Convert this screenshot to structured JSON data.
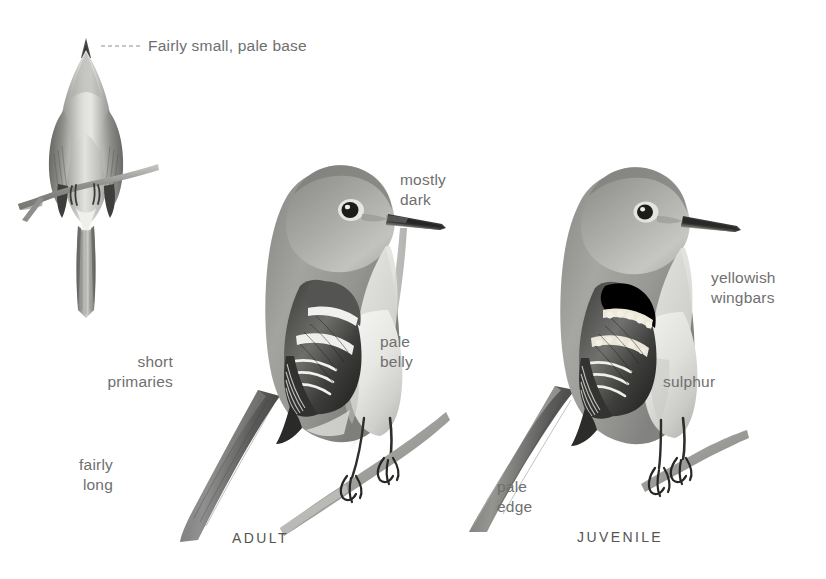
{
  "plate": {
    "medium": "graphite pencil field-guide illustration",
    "background_color": "#ffffff",
    "label_color": "#6f6f6f",
    "caption_color": "#55544f",
    "subject": "Empidonax flycatcher"
  },
  "annotations": [
    {
      "id": "bill-callout",
      "text": "Fairly small, pale base",
      "x": 148,
      "y": 36,
      "align": "left"
    },
    {
      "id": "bill-dark",
      "text": "mostly\ndark",
      "x": 400,
      "y": 170,
      "align": "left"
    },
    {
      "id": "pale-belly",
      "text": "pale\nbelly",
      "x": 380,
      "y": 332,
      "align": "left"
    },
    {
      "id": "short-primaries",
      "text": "short\nprimaries",
      "x": 173,
      "y": 352,
      "align": "right"
    },
    {
      "id": "fairly-long-tail",
      "text": "fairly\nlong",
      "x": 113,
      "y": 455,
      "align": "right"
    },
    {
      "id": "yellowish-wingbars",
      "text": "yellowish\nwingbars",
      "x": 711,
      "y": 268,
      "align": "left"
    },
    {
      "id": "sulphur",
      "text": "sulphur",
      "x": 663,
      "y": 372,
      "align": "left"
    },
    {
      "id": "pale-edge",
      "text": "pale\nedge",
      "x": 497,
      "y": 477,
      "align": "left"
    }
  ],
  "captions": [
    {
      "id": "adult",
      "text": "ADULT",
      "x": 272,
      "y": 530
    },
    {
      "id": "juvenile",
      "text": "JUVENILE",
      "x": 617,
      "y": 529
    }
  ],
  "leader_lines": [
    {
      "id": "bill-leader",
      "from_x": 101,
      "from_y": 46,
      "to_x": 143,
      "to_y": 46,
      "style": "dashed"
    }
  ],
  "figures": [
    {
      "id": "rear-view",
      "pose": "rear view perched on twig, tail hanging straight down",
      "x": 18,
      "y": 36,
      "width": 160,
      "height": 290
    },
    {
      "id": "adult",
      "pose": "side view facing right, perched on diagonal branch",
      "x": 150,
      "y": 120,
      "width": 300,
      "height": 420
    },
    {
      "id": "juvenile",
      "pose": "side view facing right, perched on branch",
      "x": 460,
      "y": 130,
      "width": 300,
      "height": 410
    }
  ]
}
